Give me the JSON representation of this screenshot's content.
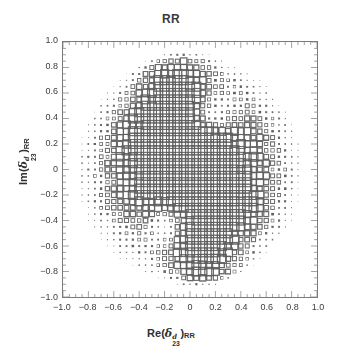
{
  "figure": {
    "title": "RR",
    "background": "#ffffff",
    "frame_color": "#7a7a7a",
    "marker_color": "#5e5e5e"
  },
  "axes": {
    "x": {
      "label_parts": {
        "prefix": "Re(",
        "symbol": "δ",
        "superscript": "d",
        "subscript": "23",
        "suffix": ")",
        "trailing_subscript": "RR"
      },
      "label_plain": "Re(δᵈ₂₃)RR",
      "min": -1.0,
      "max": 1.0,
      "ticks": [
        -1.0,
        -0.8,
        -0.6,
        -0.4,
        -0.2,
        0,
        0.2,
        0.4,
        0.6,
        0.8,
        1.0
      ],
      "tick_labels": [
        "-1.0",
        "-0.8",
        "-0.6",
        "-0.4",
        "-0.2",
        "0",
        "0.2",
        "0.4",
        "0.6",
        "0.8",
        "1.0"
      ],
      "minor_tick_step": 0.05
    },
    "y": {
      "label_parts": {
        "prefix": "Im(",
        "symbol": "δ",
        "superscript": "d",
        "subscript": "23",
        "suffix": ")",
        "trailing_subscript": "RR"
      },
      "label_plain": "Im(δᵈ₂₃)RR",
      "min": -1.0,
      "max": 1.0,
      "ticks": [
        1.0,
        0.8,
        0.6,
        0.4,
        0.2,
        0,
        -0.2,
        -0.4,
        -0.6,
        -0.8,
        -1.0
      ],
      "tick_labels": [
        "1.0",
        "0.8",
        "0.6",
        "0.4",
        "0.2",
        "0",
        "-0.2",
        "-0.4",
        "-0.6",
        "-0.8",
        "-1.0"
      ],
      "minor_tick_step": 0.05
    }
  },
  "chart_data": {
    "type": "scatter",
    "title": "RR",
    "xlabel": "Re(δᵈ₂₃)RR",
    "ylabel": "Im(δᵈ₂₃)RR",
    "xlim": [
      -1.0,
      1.0
    ],
    "ylim": [
      -1.0,
      1.0
    ],
    "grid": false,
    "legend": "none",
    "marker": "open-square",
    "marker_style_note": "Hinton-style grid of hollow squares; square side encodes magnitude",
    "grid_step": 0.05,
    "size_scale_max_px": 9,
    "annotation": "Approximately elliptical/annular density of squares centered near the origin, with two high-magnitude lobes near (-0.10, 0.65) and (0.10, -0.65) and a broad dense central band; magnitudes decay toward the edges and vanish outside a radius of about 0.85.",
    "density_model": {
      "center": [
        0.0,
        0.0
      ],
      "outer_radius": 0.85,
      "lobes": [
        {
          "cx": -0.1,
          "cy": 0.65,
          "amplitude": 1.0,
          "sigma": 0.16
        },
        {
          "cx": 0.1,
          "cy": -0.65,
          "amplitude": 1.0,
          "sigma": 0.16
        },
        {
          "cx": -0.22,
          "cy": 0.28,
          "amplitude": 0.78,
          "sigma": 0.2
        },
        {
          "cx": 0.24,
          "cy": -0.26,
          "amplitude": 0.78,
          "sigma": 0.2
        },
        {
          "cx": -0.02,
          "cy": 0.02,
          "amplitude": 0.88,
          "sigma": 0.3
        },
        {
          "cx": 0.18,
          "cy": 0.12,
          "amplitude": 0.6,
          "sigma": 0.24
        },
        {
          "cx": -0.18,
          "cy": -0.12,
          "amplitude": 0.6,
          "sigma": 0.24
        }
      ],
      "voids": [
        {
          "cx": 0.16,
          "cy": 0.4,
          "depth": 0.85,
          "sigma": 0.13
        },
        {
          "cx": -0.16,
          "cy": -0.4,
          "depth": 0.85,
          "sigma": 0.13
        }
      ],
      "base_ring": {
        "amplitude": 0.3,
        "radius": 0.5,
        "width": 0.34
      }
    }
  }
}
